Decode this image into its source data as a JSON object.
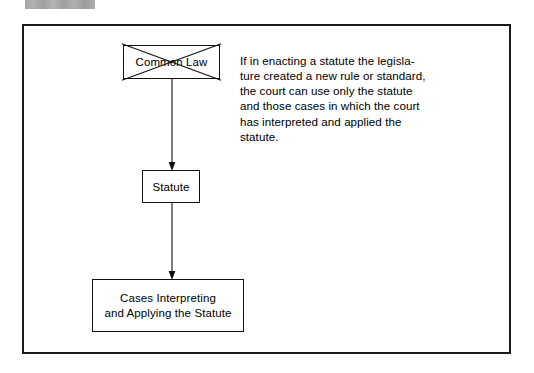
{
  "page": {
    "background_color": "#ffffff",
    "ink_color": "#000000"
  },
  "redaction": {
    "name": "redaction-bar",
    "color": "#a9a9a9"
  },
  "figure": {
    "frame_color": "#1a1a1a",
    "caption": "If in enacting a statute the legisla-\nture created a new rule or standard,\nthe court can use only the statute\nand those cases in which the court\nhas interpreted and applied the\nstatute.",
    "nodes": [
      {
        "id": "common-law",
        "label": "Common Law",
        "struck_through": true
      },
      {
        "id": "statute",
        "label": "Statute",
        "struck_through": false
      },
      {
        "id": "cases",
        "label": "Cases Interpreting\nand Applying the Statute",
        "struck_through": false
      }
    ],
    "connectors": [
      {
        "id": "common-law-to-statute",
        "from": "common-law",
        "to": "statute",
        "direction": "down",
        "arrowhead": true
      },
      {
        "id": "statute-to-cases",
        "from": "statute",
        "to": "cases",
        "direction": "down",
        "arrowhead": true
      }
    ]
  }
}
